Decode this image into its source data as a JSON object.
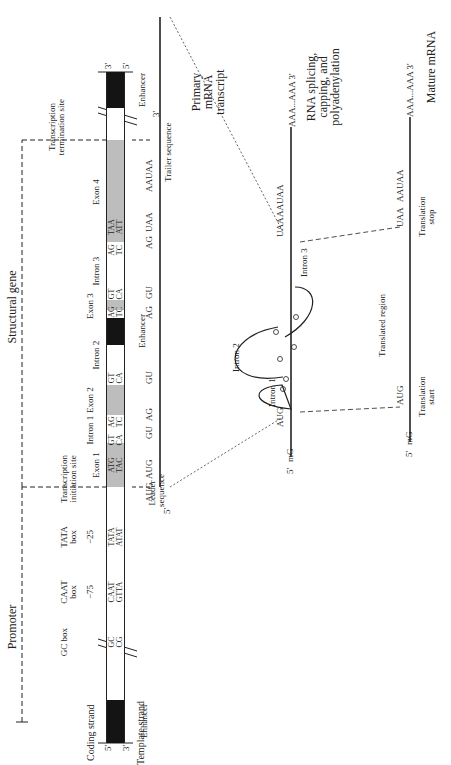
{
  "strand_labels": {
    "coding": "Coding strand",
    "template": "Template strand",
    "coding_5": "5'",
    "template_3": "3'",
    "coding_3": "3'",
    "template_5": "5'"
  },
  "regions": {
    "promoter": "Promoter",
    "structural_gene": "Structural gene"
  },
  "promoter_elements": {
    "gc_box": "GC box",
    "caat_box": "CAAT box",
    "tata_box": "TATA box",
    "pos_75": "−75",
    "pos_25": "−25",
    "gc_seq_top": "GC",
    "gc_seq_bottom": "CG",
    "caat_seq_top": "CAAT",
    "caat_seq_bottom": "GTTA",
    "tata_seq_top": "TATA",
    "tata_seq_bottom": "ATAT"
  },
  "gene_labels": {
    "transcription_initiation_site": "Transcription initiation site",
    "transcription_termination_site": "Transcription termination site",
    "exon1": "Exon 1",
    "intron1": "Intron 1",
    "exon2": "Exon 2",
    "intron2": "Intron 2",
    "exon3": "Exon 3",
    "intron3": "Intron 3",
    "exon4": "Exon 4",
    "enhancer_left": "Enhancer",
    "enhancer_mid": "Enhancer",
    "enhancer_right": "Enhancer"
  },
  "bar_sequences": {
    "atg_top": "ATG",
    "atg_bottom": "TAC",
    "i1_gt_top": "GT",
    "i1_gt_bottom": "CA",
    "i1_ag_top": "AG",
    "i1_ag_bottom": "TC",
    "i2_gt_top": "GT",
    "i2_gt_bottom": "CA",
    "i2_ag_top": "AG",
    "i2_ag_bottom": "TC",
    "i3_gt_top": "GT",
    "i3_gt_bottom": "CA",
    "i3_ag_top": "AG",
    "i3_ag_bottom": "TC",
    "taa_top": "TAA",
    "taa_bottom": "ATT"
  },
  "primary_transcript": {
    "title": "Primary mRNA transcript",
    "five_prime": "5'",
    "three_prime": "3'",
    "leader": "Leader sequence",
    "trailer": "Trailer sequence",
    "aug": "AUG",
    "gu1": "GU",
    "ag1": "AG",
    "gu2": "GU",
    "ag2": "AG",
    "gu3": "GU",
    "ag3": "AG",
    "uaa": "UAA",
    "aauaa": "AAUAA"
  },
  "processing": {
    "title": "RNA splicing, capping, and polyadenylation",
    "five_prime": "5'",
    "cap": "mG",
    "aug": "AUG",
    "uaa": "UAA",
    "aauaa": "AAUAA",
    "polya": "AAA...AAA 3'",
    "intron1": "Intron 1",
    "intron2": "Intron 2",
    "intron3": "Intron 3"
  },
  "mature": {
    "title": "Mature mRNA",
    "five_prime": "5'",
    "cap": "mG",
    "aug": "AUG",
    "uaa": "UAA",
    "aauaa": "AAUAA",
    "polya": "AAA...AAA 3'",
    "translated_region": "Translated region",
    "translation_start": "Translation start",
    "translation_stop": "Translation stop"
  }
}
